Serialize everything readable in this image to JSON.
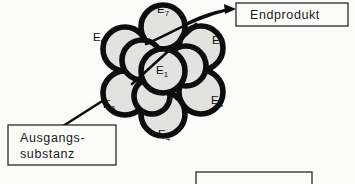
{
  "figure": {
    "background_color": "#fbfbf9",
    "ink_color": "#0d0d0d",
    "circle_fill_color": "#e2e2e0"
  },
  "boxes": {
    "endproduct": {
      "label": "Endprodukt",
      "x": 236,
      "y": 3,
      "width": 112,
      "height": 23
    },
    "substrate": {
      "line1": "Ausgangs-",
      "line2": "substanz",
      "x": 8,
      "y": 125,
      "width": 108,
      "height": 40
    },
    "cropped_bottom": {
      "label": "",
      "x": 196,
      "y": 172,
      "width": 116,
      "height": 12
    }
  },
  "enzymes": [
    {
      "id": "E1",
      "letter": "E",
      "subscript": "1",
      "x": 160,
      "y": 72,
      "role": "center"
    },
    {
      "id": "E2",
      "letter": "E",
      "subscript": "2",
      "x": 212,
      "y": 44,
      "role": "upper-right"
    },
    {
      "id": "E3",
      "letter": "E",
      "subscript": "3",
      "x": 211,
      "y": 101,
      "role": "lower-right"
    },
    {
      "id": "E4",
      "letter": "E",
      "subscript": "4",
      "x": 161,
      "y": 134,
      "role": "bottom"
    },
    {
      "id": "E5",
      "letter": "E",
      "subscript": "5",
      "x": 104,
      "y": 105,
      "role": "lower-left"
    },
    {
      "id": "E6",
      "letter": "E",
      "subscript": "6",
      "x": 93,
      "y": 41,
      "role": "upper-left"
    },
    {
      "id": "E7",
      "letter": "E",
      "subscript": "7",
      "x": 157,
      "y": 13,
      "role": "top"
    }
  ],
  "cluster": {
    "center_x": 163,
    "center_y": 70,
    "circles": [
      {
        "cx": 163,
        "cy": 71,
        "r": 22
      },
      {
        "cx": 163,
        "cy": 27,
        "r": 22
      },
      {
        "cx": 201,
        "cy": 48,
        "r": 22
      },
      {
        "cx": 201,
        "cy": 92,
        "r": 22
      },
      {
        "cx": 163,
        "cy": 114,
        "r": 22
      },
      {
        "cx": 125,
        "cy": 93,
        "r": 22
      },
      {
        "cx": 125,
        "cy": 49,
        "r": 22
      },
      {
        "cx": 142,
        "cy": 60,
        "r": 20
      },
      {
        "cx": 184,
        "cy": 66,
        "r": 20
      },
      {
        "cx": 150,
        "cy": 95,
        "r": 18
      }
    ]
  },
  "connectors": {
    "product_arrow": {
      "from": "E7/cluster-top-right",
      "to": "endproduct-box",
      "has_arrowhead": true
    },
    "substrate_line": {
      "from": "substrate-box",
      "to": "E5/cluster-lower-left",
      "has_arrowhead": false
    },
    "internal_chord": {
      "description": "diagonal chord crossing cluster from lower-left to upper-right"
    }
  }
}
